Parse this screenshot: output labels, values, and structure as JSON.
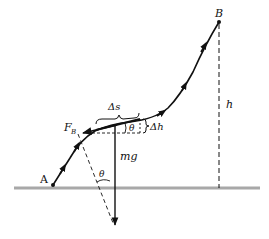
{
  "diagram": {
    "type": "physics-free-body-path",
    "labels": {
      "start_point": "A",
      "end_point": "B",
      "height": "h",
      "arc_length": "Δs",
      "height_increment": "Δh",
      "angle_top": "θ",
      "angle_bottom": "θ",
      "normal_force_main": "F",
      "normal_force_sub": "B",
      "weight": "mg"
    },
    "colors": {
      "ink": "#111111",
      "ground": "#a8a8a8"
    }
  }
}
